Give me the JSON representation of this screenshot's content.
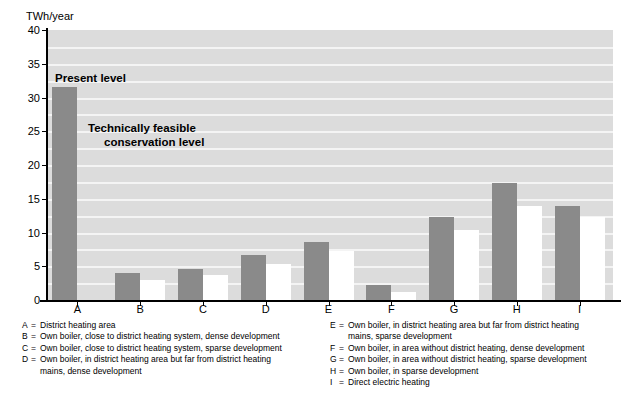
{
  "chart_data": {
    "type": "bar",
    "title": "",
    "ylabel": "TWh/year",
    "xlabel": "",
    "ylim": [
      0,
      40
    ],
    "yticks": [
      0,
      5,
      10,
      15,
      20,
      25,
      30,
      35,
      40
    ],
    "grid": true,
    "legend_position": "in-plot-annotations",
    "categories": [
      "A",
      "B",
      "C",
      "D",
      "E",
      "F",
      "G",
      "H",
      "I"
    ],
    "series": [
      {
        "name": "Present level",
        "color": "#8a8a8a",
        "values": [
          31.5,
          4.0,
          4.6,
          6.6,
          8.6,
          2.2,
          12.3,
          17.3,
          13.9
        ]
      },
      {
        "name": "Technically feasible conservation level",
        "color": "#ffffff",
        "values": [
          0.0,
          2.9,
          3.7,
          5.3,
          7.2,
          1.2,
          10.4,
          13.9,
          12.3
        ]
      }
    ],
    "annotations": [
      {
        "id": "present-level",
        "text": "Present level"
      },
      {
        "id": "conservation-level",
        "line1": "Technically feasible",
        "line2": "conservation level"
      }
    ]
  },
  "axis": {
    "y_title": "TWh/year",
    "y_tick_labels": [
      "40",
      "35",
      "30",
      "25",
      "20",
      "15",
      "10",
      "5",
      "0"
    ],
    "x_tick_labels": [
      "A",
      "B",
      "C",
      "D",
      "E",
      "F",
      "G",
      "H",
      "I"
    ]
  },
  "annotations": {
    "present_level": "Present level",
    "conservation_line1": "Technically feasible",
    "conservation_line2": "conservation level"
  },
  "legend": {
    "left_column": [
      {
        "key": "A",
        "eq": "=",
        "text": "District heating area",
        "cont": ""
      },
      {
        "key": "B",
        "eq": "=",
        "text": "Own boiler, close to district heating system, dense development",
        "cont": ""
      },
      {
        "key": "C",
        "eq": "=",
        "text": "Own boiler, close to district heating system, sparse development",
        "cont": ""
      },
      {
        "key": "D",
        "eq": "=",
        "text": "Own boiler, in district heating area but far from district heating",
        "cont": "mains, dense development"
      }
    ],
    "right_column": [
      {
        "key": "E",
        "eq": "=",
        "text": "Own boiler, in district heating area but far from district heating",
        "cont": "mains, sparse development"
      },
      {
        "key": "F",
        "eq": "=",
        "text": "Own boiler, in area without district heating, dense development",
        "cont": ""
      },
      {
        "key": "G",
        "eq": "=",
        "text": "Own boiler, in area without district heating, sparse development",
        "cont": ""
      },
      {
        "key": "H",
        "eq": "=",
        "text": "Own boiler, in sparse development",
        "cont": ""
      },
      {
        "key": "I",
        "eq": "=",
        "text": "Direct electric heating",
        "cont": ""
      }
    ]
  },
  "colors": {
    "plot_background": "#dcdcdc",
    "gridline": "#f4f4f4",
    "present_bar": "#8a8a8a",
    "conservation_bar": "#ffffff",
    "axis": "#000000",
    "page_background": "#ffffff"
  }
}
